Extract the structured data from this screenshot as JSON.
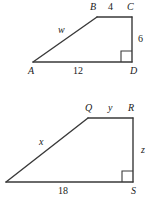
{
  "figure": {
    "stroke_color": "#3a3a3a",
    "text_color": "#1a1a1a",
    "background": "#ffffff"
  },
  "top_figure": {
    "name": "trapezoid-ABCD",
    "vertices": [
      {
        "id": "A",
        "label": "A",
        "x": 33,
        "y": 62,
        "label_x": 28,
        "label_y": 66
      },
      {
        "id": "B",
        "label": "B",
        "x": 97,
        "y": 17,
        "label_x": 90,
        "label_y": 2
      },
      {
        "id": "C",
        "label": "C",
        "x": 132,
        "y": 17,
        "label_x": 127,
        "label_y": 2
      },
      {
        "id": "D",
        "label": "D",
        "x": 132,
        "y": 62,
        "label_x": 130,
        "label_y": 66
      }
    ],
    "side_labels": [
      {
        "id": "w",
        "text": "w",
        "italic": true,
        "x": 58,
        "y": 25
      },
      {
        "id": "BC",
        "text": "4",
        "italic": false,
        "x": 108,
        "y": 2
      },
      {
        "id": "CD",
        "text": "6",
        "italic": false,
        "x": 138,
        "y": 34
      },
      {
        "id": "AD",
        "text": "12",
        "italic": false,
        "x": 73,
        "y": 66
      }
    ],
    "right_angle": {
      "at": "D",
      "x": 121,
      "y": 51,
      "size": 11
    }
  },
  "bottom_figure": {
    "name": "trapezoid-PQRS",
    "vertices": [
      {
        "id": "P",
        "label": "",
        "x": 6,
        "y": 182,
        "label_x": 0,
        "label_y": 186
      },
      {
        "id": "Q",
        "label": "Q",
        "x": 88,
        "y": 118,
        "label_x": 85,
        "label_y": 103
      },
      {
        "id": "R",
        "label": "R",
        "x": 133,
        "y": 118,
        "label_x": 128,
        "label_y": 103
      },
      {
        "id": "S",
        "label": "S",
        "x": 133,
        "y": 182,
        "label_x": 131,
        "label_y": 186
      }
    ],
    "side_labels": [
      {
        "id": "x",
        "text": "x",
        "italic": true,
        "x": 39,
        "y": 137
      },
      {
        "id": "QR",
        "text": "y",
        "italic": true,
        "x": 108,
        "y": 103
      },
      {
        "id": "RS",
        "text": "z",
        "italic": true,
        "x": 141,
        "y": 145
      },
      {
        "id": "PS",
        "text": "18",
        "italic": false,
        "x": 58,
        "y": 186
      }
    ],
    "right_angle": {
      "at": "S",
      "x": 122,
      "y": 171,
      "size": 11
    }
  }
}
